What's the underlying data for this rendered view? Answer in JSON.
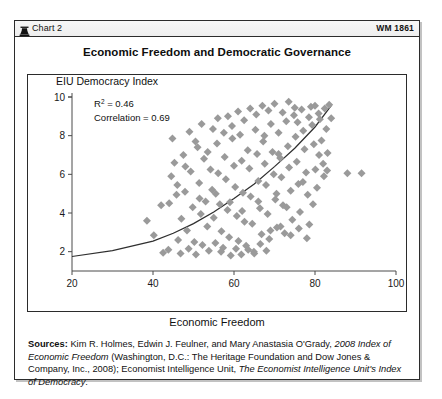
{
  "header": {
    "icon": "bell-icon",
    "chart_label": "Chart 2",
    "wm_label": "WM 1861"
  },
  "title": "Economic Freedom and Democratic Governance",
  "sources": {
    "label": "Sources:",
    "text_1": " Kim R. Holmes, Edwin J. Feulner, and Mary Anastasia O'Grady, ",
    "italic_1": "2008 Index of Economic Freedom",
    "text_2": " (Washington, D.C.: The Heritage Foundation and Dow Jones & Company, Inc., 2008); Economist Intelligence Unit, ",
    "italic_2": "The Economist Intelligence Unit's Index of Democracy",
    "text_3": "."
  },
  "chart_data": {
    "type": "scatter",
    "title": "Economic Freedom and Democratic Governance",
    "xlabel": "Economic Freedom",
    "ylabel": "EIU Democracy Index",
    "xlim": [
      20,
      100
    ],
    "ylim": [
      1,
      10
    ],
    "xticks": [
      20,
      40,
      60,
      80,
      100
    ],
    "yticks": [
      2,
      4,
      6,
      8,
      10
    ],
    "grid": false,
    "legend": null,
    "annotations": [
      {
        "label": "R² =",
        "value": "0.46",
        "text": "R2 = 0.46"
      },
      {
        "label": "Correlation =",
        "value": "0.69",
        "text": "Correlation = 0.69"
      }
    ],
    "statistics": {
      "r_squared": 0.46,
      "correlation": 0.69
    },
    "marker": {
      "shape": "diamond",
      "color": "#9a9a9a",
      "size": 4
    },
    "trendline": {
      "type": "exponential",
      "color": "#2f2f2f",
      "points": [
        [
          20,
          1.75
        ],
        [
          30,
          2.05
        ],
        [
          40,
          2.55
        ],
        [
          45,
          2.95
        ],
        [
          50,
          3.45
        ],
        [
          55,
          4.05
        ],
        [
          60,
          4.75
        ],
        [
          65,
          5.5
        ],
        [
          70,
          6.4
        ],
        [
          75,
          7.35
        ],
        [
          80,
          8.45
        ],
        [
          84,
          9.55
        ]
      ]
    },
    "points": [
      [
        38.5,
        3.6
      ],
      [
        40.2,
        2.85
      ],
      [
        42.5,
        1.95
      ],
      [
        43.8,
        2.1
      ],
      [
        44.5,
        5.9
      ],
      [
        45.3,
        6.6
      ],
      [
        45.8,
        4.95
      ],
      [
        46.2,
        2.6
      ],
      [
        46.8,
        1.9
      ],
      [
        47.5,
        7.0
      ],
      [
        47.9,
        5.1
      ],
      [
        48.4,
        3.1
      ],
      [
        48.8,
        2.15
      ],
      [
        49.3,
        6.15
      ],
      [
        49.8,
        4.3
      ],
      [
        50.2,
        2.5
      ],
      [
        50.6,
        1.85
      ],
      [
        51.0,
        7.4
      ],
      [
        51.4,
        5.55
      ],
      [
        51.8,
        3.95
      ],
      [
        52.2,
        2.35
      ],
      [
        52.6,
        6.8
      ],
      [
        53.0,
        4.6
      ],
      [
        53.4,
        3.3
      ],
      [
        53.8,
        2.05
      ],
      [
        54.2,
        6.25
      ],
      [
        54.6,
        5.2
      ],
      [
        55.0,
        3.75
      ],
      [
        55.4,
        2.45
      ],
      [
        55.8,
        7.6
      ],
      [
        56.1,
        6.05
      ],
      [
        56.5,
        4.45
      ],
      [
        56.9,
        3.05
      ],
      [
        57.3,
        2.2
      ],
      [
        57.7,
        6.9
      ],
      [
        58.0,
        5.75
      ],
      [
        58.4,
        4.15
      ],
      [
        58.8,
        2.75
      ],
      [
        59.2,
        1.8
      ],
      [
        59.6,
        7.85
      ],
      [
        60.0,
        6.45
      ],
      [
        60.3,
        5.35
      ],
      [
        60.7,
        3.85
      ],
      [
        61.1,
        2.55
      ],
      [
        61.5,
        8.05
      ],
      [
        61.9,
        6.7
      ],
      [
        62.2,
        5.05
      ],
      [
        62.6,
        3.55
      ],
      [
        63.0,
        2.3
      ],
      [
        63.4,
        7.25
      ],
      [
        63.8,
        6.3
      ],
      [
        64.1,
        4.85
      ],
      [
        64.5,
        3.45
      ],
      [
        64.9,
        2.0
      ],
      [
        65.3,
        8.3
      ],
      [
        65.7,
        7.05
      ],
      [
        66.0,
        5.65
      ],
      [
        66.4,
        4.25
      ],
      [
        66.8,
        2.9
      ],
      [
        67.2,
        7.7
      ],
      [
        67.6,
        6.55
      ],
      [
        67.9,
        5.45
      ],
      [
        68.3,
        3.95
      ],
      [
        68.7,
        2.65
      ],
      [
        69.1,
        8.6
      ],
      [
        69.5,
        7.15
      ],
      [
        69.8,
        6.0
      ],
      [
        70.2,
        4.7
      ],
      [
        70.6,
        3.25
      ],
      [
        71.0,
        8.15
      ],
      [
        71.4,
        6.85
      ],
      [
        71.7,
        5.85
      ],
      [
        72.1,
        4.4
      ],
      [
        72.5,
        2.95
      ],
      [
        72.9,
        8.75
      ],
      [
        73.3,
        7.45
      ],
      [
        73.6,
        6.35
      ],
      [
        74.0,
        5.15
      ],
      [
        74.4,
        3.65
      ],
      [
        74.8,
        9.05
      ],
      [
        75.2,
        7.95
      ],
      [
        75.5,
        6.65
      ],
      [
        75.9,
        5.5
      ],
      [
        76.3,
        4.05
      ],
      [
        76.7,
        9.35
      ],
      [
        77.1,
        8.25
      ],
      [
        77.4,
        7.3
      ],
      [
        77.8,
        6.1
      ],
      [
        78.2,
        4.95
      ],
      [
        78.6,
        3.4
      ],
      [
        79.0,
        9.5
      ],
      [
        79.3,
        8.55
      ],
      [
        79.7,
        7.55
      ],
      [
        80.1,
        6.25
      ],
      [
        80.5,
        5.3
      ],
      [
        80.9,
        9.15
      ],
      [
        81.2,
        8.85
      ],
      [
        81.6,
        7.75
      ],
      [
        82.0,
        6.55
      ],
      [
        82.4,
        9.4
      ],
      [
        82.8,
        8.35
      ],
      [
        83.1,
        7.1
      ],
      [
        83.5,
        9.6
      ],
      [
        84.0,
        8.9
      ],
      [
        44.0,
        4.5
      ],
      [
        46.0,
        5.45
      ],
      [
        48.0,
        6.4
      ],
      [
        49.0,
        8.2
      ],
      [
        50.5,
        7.7
      ],
      [
        52.0,
        8.6
      ],
      [
        53.5,
        7.15
      ],
      [
        54.8,
        8.35
      ],
      [
        56.0,
        8.9
      ],
      [
        57.5,
        8.15
      ],
      [
        58.5,
        9.0
      ],
      [
        59.5,
        8.5
      ],
      [
        61.0,
        9.25
      ],
      [
        62.5,
        8.8
      ],
      [
        64.0,
        9.4
      ],
      [
        65.5,
        9.1
      ],
      [
        67.0,
        9.55
      ],
      [
        68.5,
        9.3
      ],
      [
        70.0,
        9.65
      ],
      [
        72.0,
        9.2
      ],
      [
        73.5,
        9.75
      ],
      [
        75.0,
        9.45
      ],
      [
        61.8,
        1.85
      ],
      [
        63.5,
        2.1
      ],
      [
        65.0,
        1.9
      ],
      [
        66.5,
        2.4
      ],
      [
        68.0,
        2.05
      ],
      [
        69.0,
        3.1
      ],
      [
        71.5,
        3.3
      ],
      [
        74.0,
        2.85
      ],
      [
        76.0,
        3.2
      ],
      [
        78.0,
        2.7
      ],
      [
        88.0,
        6.05
      ],
      [
        91.5,
        6.05
      ],
      [
        47.0,
        3.7
      ],
      [
        51.5,
        4.75
      ],
      [
        55.5,
        5.0
      ],
      [
        59.0,
        4.55
      ],
      [
        62.0,
        4.1
      ],
      [
        66.0,
        4.6
      ],
      [
        70.5,
        5.0
      ],
      [
        73.0,
        4.3
      ],
      [
        77.0,
        5.6
      ],
      [
        79.5,
        4.45
      ],
      [
        42.0,
        4.4
      ],
      [
        44.8,
        7.85
      ],
      [
        56.8,
        2.0
      ],
      [
        60.5,
        2.15
      ],
      [
        67.5,
        8.0
      ],
      [
        71.0,
        7.05
      ],
      [
        75.7,
        8.7
      ],
      [
        81.0,
        7.0
      ],
      [
        82.2,
        5.9
      ],
      [
        83.0,
        6.2
      ],
      [
        80.0,
        9.55
      ],
      [
        78.5,
        8.95
      ]
    ]
  }
}
